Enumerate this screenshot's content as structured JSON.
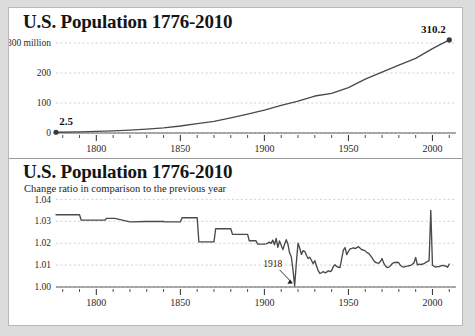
{
  "figure": {
    "background": "#ffffff",
    "border_color": "#b8b8b8",
    "outer_background": "#dcdcdc",
    "line_color": "#4a4a4a",
    "grid_color": "#c9c9c9"
  },
  "chart_data": [
    {
      "id": "population-total",
      "type": "line",
      "title": "U.S. Population 1776-2010",
      "xlabel": "",
      "ylabel": "",
      "y_unit_label": "300 million",
      "ylim": [
        0,
        330
      ],
      "xlim": [
        1776,
        2014
      ],
      "grid": true,
      "legend": "none",
      "yticks": [
        0,
        100,
        200,
        300
      ],
      "ytick_labels": [
        "0",
        "100",
        "200",
        "300 million"
      ],
      "xticks_major": [
        1800,
        1850,
        1900,
        1950,
        2000
      ],
      "xtick_labels": [
        "1800",
        "1850",
        "1900",
        "1950",
        "2000"
      ],
      "xticks_minor_step": 10,
      "annotations": [
        {
          "label": "2.5",
          "x": 1776,
          "y": 2.5,
          "marker": true
        },
        {
          "label": "310.2",
          "x": 2010,
          "y": 310.2,
          "marker": true
        }
      ],
      "x": [
        1776,
        1790,
        1800,
        1810,
        1820,
        1830,
        1840,
        1850,
        1860,
        1870,
        1880,
        1890,
        1900,
        1910,
        1920,
        1930,
        1940,
        1950,
        1960,
        1970,
        1980,
        1990,
        2000,
        2010
      ],
      "values": [
        2.5,
        3.9,
        5.3,
        7.2,
        9.6,
        12.9,
        17.1,
        23.2,
        31.4,
        38.6,
        50.2,
        63.0,
        76.2,
        92.2,
        106.0,
        123.2,
        132.2,
        151.3,
        179.3,
        203.2,
        226.5,
        248.7,
        281.4,
        310.2
      ]
    },
    {
      "id": "population-change-ratio",
      "type": "line",
      "title": "U.S. Population 1776-2010",
      "subtitle": "Change ratio in comparison to the previous year",
      "xlabel": "",
      "ylabel": "",
      "ylim": [
        1.0,
        1.042
      ],
      "xlim": [
        1776,
        2014
      ],
      "grid": true,
      "legend": "none",
      "yticks": [
        1.0,
        1.01,
        1.02,
        1.03,
        1.04
      ],
      "ytick_labels": [
        "1.00",
        "1.01",
        "1.02",
        "1.03",
        "1.04"
      ],
      "xticks_major": [
        1800,
        1850,
        1900,
        1950,
        2000
      ],
      "xtick_labels": [
        "1800",
        "1850",
        "1900",
        "1950",
        "2000"
      ],
      "xticks_minor_step": 10,
      "annotations": [
        {
          "label": "1918",
          "x": 1918,
          "y": 1.0005,
          "arrow": true
        }
      ],
      "x": [
        1776,
        1785,
        1790,
        1791,
        1800,
        1801,
        1805,
        1806,
        1810,
        1811,
        1820,
        1821,
        1830,
        1831,
        1840,
        1841,
        1850,
        1851,
        1855,
        1856,
        1860,
        1861,
        1865,
        1866,
        1870,
        1871,
        1880,
        1881,
        1890,
        1891,
        1895,
        1896,
        1900,
        1901,
        1902,
        1903,
        1904,
        1905,
        1906,
        1907,
        1908,
        1909,
        1910,
        1911,
        1912,
        1913,
        1914,
        1915,
        1916,
        1917,
        1918,
        1919,
        1920,
        1921,
        1922,
        1923,
        1924,
        1925,
        1926,
        1927,
        1928,
        1929,
        1930,
        1931,
        1932,
        1933,
        1934,
        1935,
        1936,
        1937,
        1938,
        1939,
        1940,
        1941,
        1942,
        1943,
        1944,
        1945,
        1946,
        1947,
        1948,
        1949,
        1950,
        1951,
        1952,
        1953,
        1954,
        1955,
        1956,
        1957,
        1958,
        1959,
        1960,
        1961,
        1962,
        1963,
        1964,
        1965,
        1966,
        1967,
        1968,
        1969,
        1970,
        1971,
        1972,
        1973,
        1974,
        1975,
        1976,
        1977,
        1978,
        1979,
        1980,
        1981,
        1982,
        1983,
        1984,
        1985,
        1986,
        1987,
        1988,
        1989,
        1990,
        1991,
        1992,
        1993,
        1994,
        1995,
        1996,
        1997,
        1998,
        1999,
        2000,
        2001,
        2002,
        2003,
        2004,
        2005,
        2006,
        2007,
        2008,
        2009,
        2010
      ],
      "values": [
        1.033,
        1.033,
        1.033,
        1.0305,
        1.0305,
        1.0305,
        1.0305,
        1.0313,
        1.0313,
        1.0313,
        1.0297,
        1.0297,
        1.0299,
        1.0299,
        1.0299,
        1.0297,
        1.0297,
        1.0316,
        1.0316,
        1.0316,
        1.0316,
        1.0206,
        1.0206,
        1.0206,
        1.0206,
        1.0266,
        1.0266,
        1.024,
        1.024,
        1.0211,
        1.0211,
        1.0196,
        1.0196,
        1.0197,
        1.02,
        1.0205,
        1.0199,
        1.0214,
        1.0193,
        1.0222,
        1.0181,
        1.021,
        1.019,
        1.0171,
        1.0195,
        1.0216,
        1.0196,
        1.0155,
        1.0138,
        1.0079,
        1.0005,
        1.011,
        1.02,
        1.0178,
        1.0149,
        1.0166,
        1.0163,
        1.0145,
        1.013,
        1.0136,
        1.0122,
        1.0106,
        1.012,
        1.0096,
        1.0075,
        1.0062,
        1.0065,
        1.007,
        1.0065,
        1.0068,
        1.0074,
        1.007,
        1.0075,
        1.0093,
        1.0102,
        1.0094,
        1.009,
        1.0089,
        1.013,
        1.0168,
        1.018,
        1.0148,
        1.0163,
        1.0174,
        1.0176,
        1.0179,
        1.0175,
        1.018,
        1.0184,
        1.0177,
        1.017,
        1.0168,
        1.0165,
        1.0157,
        1.0154,
        1.0144,
        1.0134,
        1.0121,
        1.0113,
        1.011,
        1.0108,
        1.0116,
        1.013,
        1.0109,
        1.0096,
        1.0089,
        1.0091,
        1.0097,
        1.0106,
        1.0111,
        1.0112,
        1.0113,
        1.011,
        1.0098,
        1.0093,
        1.0091,
        1.0094,
        1.0095,
        1.0097,
        1.0099,
        1.0104,
        1.011,
        1.0135,
        1.0101,
        1.0104,
        1.0102,
        1.0105,
        1.0107,
        1.0112,
        1.0116,
        1.012,
        1.035,
        1.0099,
        1.0094,
        1.0091,
        1.0093,
        1.0093,
        1.0096,
        1.0099,
        1.0097,
        1.0096,
        1.009,
        1.0105
      ]
    }
  ]
}
